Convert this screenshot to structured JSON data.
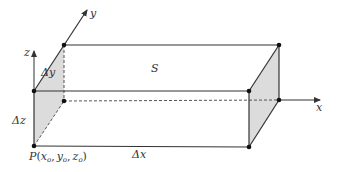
{
  "diagram": {
    "type": "3d-box-volume-element",
    "colors": {
      "line": "#333333",
      "face_fill": "#dcdcdc",
      "background": "#ffffff"
    },
    "axes": {
      "x": {
        "label": "x"
      },
      "y": {
        "label": "y"
      },
      "z": {
        "label": "z"
      }
    },
    "labels": {
      "surface": "S",
      "dx": "Δx",
      "dy": "Δy",
      "dz": "Δz",
      "point_P": "P",
      "point_open": "(",
      "x0": "x",
      "y0": "y",
      "z0": "z",
      "sub": "o",
      "comma": ",",
      "point_close": ")"
    }
  }
}
